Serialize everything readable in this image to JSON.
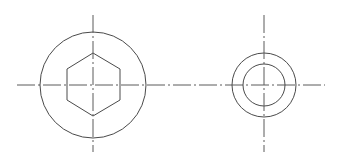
{
  "drawing": {
    "type": "orthographic-views",
    "colors": {
      "outline": "#4a4a4a",
      "centerline": "#5a5a5a",
      "background": "#ffffff"
    },
    "views": [
      {
        "name": "front-view",
        "center": [
          93,
          85
        ],
        "outer_circle_radius": 53,
        "hexagon": {
          "points": "93,53 120,69 120,100 93,116 67,100 67,69"
        },
        "vertical_centerline": {
          "y1": 15,
          "y2": 152
        }
      },
      {
        "name": "side-view",
        "center": [
          264,
          85
        ],
        "outer_circle_radius": 32,
        "inner_circle_radius": 21,
        "vertical_centerline": {
          "y1": 15,
          "y2": 152
        }
      }
    ],
    "horizontal_centerline": {
      "x1": 17,
      "x2": 325,
      "y": 85
    }
  }
}
